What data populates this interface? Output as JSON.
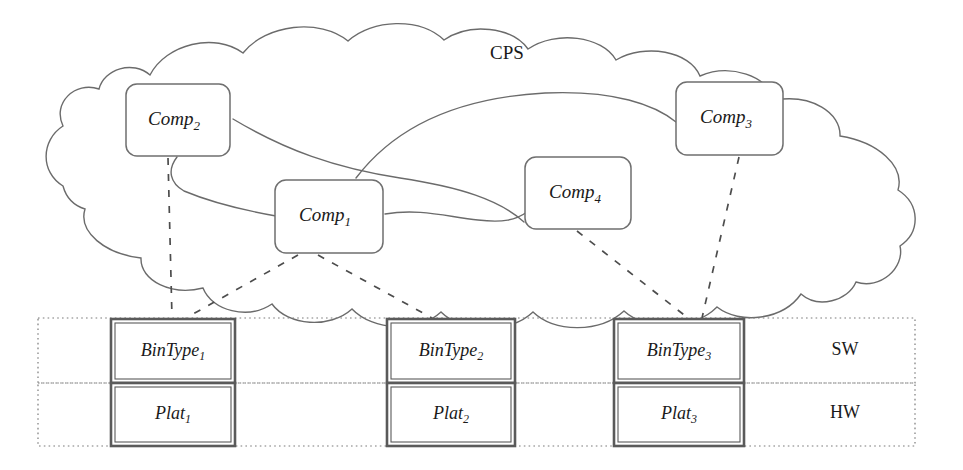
{
  "diagram": {
    "cloud": {
      "label": "CPS"
    },
    "components": [
      {
        "id": "comp1",
        "base": "Comp",
        "sub": "1",
        "full": "Comp1"
      },
      {
        "id": "comp2",
        "base": "Comp",
        "sub": "2",
        "full": "Comp2"
      },
      {
        "id": "comp3",
        "base": "Comp",
        "sub": "3",
        "full": "Comp3"
      },
      {
        "id": "comp4",
        "base": "Comp",
        "sub": "4",
        "full": "Comp4"
      }
    ],
    "layers": [
      {
        "id": "sw",
        "label": "SW"
      },
      {
        "id": "hw",
        "label": "HW"
      }
    ],
    "stacks": [
      {
        "id": "stack1",
        "bintype": {
          "base": "BinType",
          "sub": "1",
          "full": "BinType1"
        },
        "platform": {
          "base": "Plat",
          "sub": "1",
          "full": "Plat1"
        }
      },
      {
        "id": "stack2",
        "bintype": {
          "base": "BinType",
          "sub": "2",
          "full": "BinType2"
        },
        "platform": {
          "base": "Plat",
          "sub": "2",
          "full": "Plat2"
        }
      },
      {
        "id": "stack3",
        "bintype": {
          "base": "BinType",
          "sub": "3",
          "full": "BinType3"
        },
        "platform": {
          "base": "Plat",
          "sub": "3",
          "full": "Plat3"
        }
      }
    ],
    "colors": {
      "background": "#ffffff",
      "outline": "#6b6b6b",
      "text": "#1a1a1a",
      "box_stroke": "#5a5a5a",
      "dashed": "#4d4d4d"
    }
  }
}
